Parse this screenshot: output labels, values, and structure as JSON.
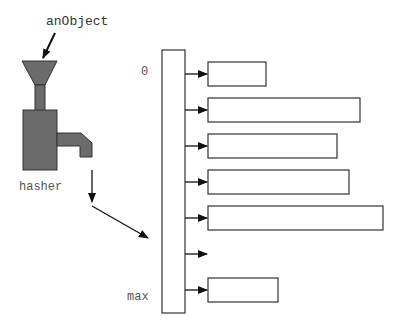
{
  "labels": {
    "input": "anObject",
    "hasher": "hasher",
    "index_min": "0",
    "index_max": "max"
  },
  "colors": {
    "hasher_fill": "#6b6b6b",
    "stroke": "#333333",
    "text": "#555555"
  },
  "buckets": [
    {
      "index": 0,
      "width": 58,
      "empty": false
    },
    {
      "index": 1,
      "width": 152,
      "empty": false
    },
    {
      "index": 2,
      "width": 129,
      "empty": false
    },
    {
      "index": 3,
      "width": 141,
      "empty": false
    },
    {
      "index": 4,
      "width": 175,
      "empty": false
    },
    {
      "index": 5,
      "width": 0,
      "empty": true
    },
    {
      "index": 6,
      "width": 70,
      "empty": false
    }
  ]
}
